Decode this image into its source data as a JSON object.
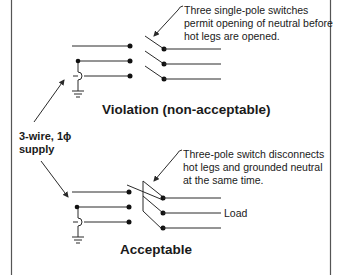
{
  "diagram": {
    "type": "wiring-schematic",
    "supply_label": {
      "line1": "3-wire, 1ϕ",
      "line2": "supply"
    },
    "violation": {
      "title": "Violation (non-acceptable)",
      "callout": [
        "Three single-pole switches",
        "permit opening of neutral before",
        "hot legs are opened."
      ]
    },
    "acceptable": {
      "title": "Acceptable",
      "callout": [
        "Three-pole switch disconnects",
        "hot legs and grounded neutral",
        "at the same time."
      ],
      "load_label": "Load"
    },
    "colors": {
      "line": "#2a2a2a",
      "text": "#1a1a1a",
      "background": "#ffffff"
    }
  }
}
